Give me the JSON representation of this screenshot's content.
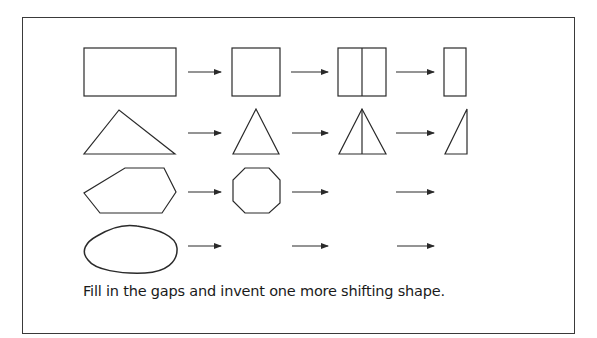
{
  "caption": "Fill in the gaps and invent one more shifting shape.",
  "colors": {
    "stroke": "#2a2a2a",
    "border": "#3a3a3a",
    "background": "#ffffff"
  },
  "rows": [
    {
      "name": "rectangle",
      "stages": [
        "wide-rectangle",
        "square",
        "square-bisected-vertically",
        "narrow-rectangle"
      ]
    },
    {
      "name": "triangle",
      "stages": [
        "scalene-triangle",
        "isosceles-triangle",
        "isosceles-triangle-bisected",
        "right-triangle"
      ]
    },
    {
      "name": "polygon",
      "stages": [
        "irregular-hexagon",
        "octagon",
        "blank",
        "blank"
      ]
    },
    {
      "name": "blob",
      "stages": [
        "irregular-blob",
        "blank",
        "blank",
        "blank"
      ]
    }
  ]
}
